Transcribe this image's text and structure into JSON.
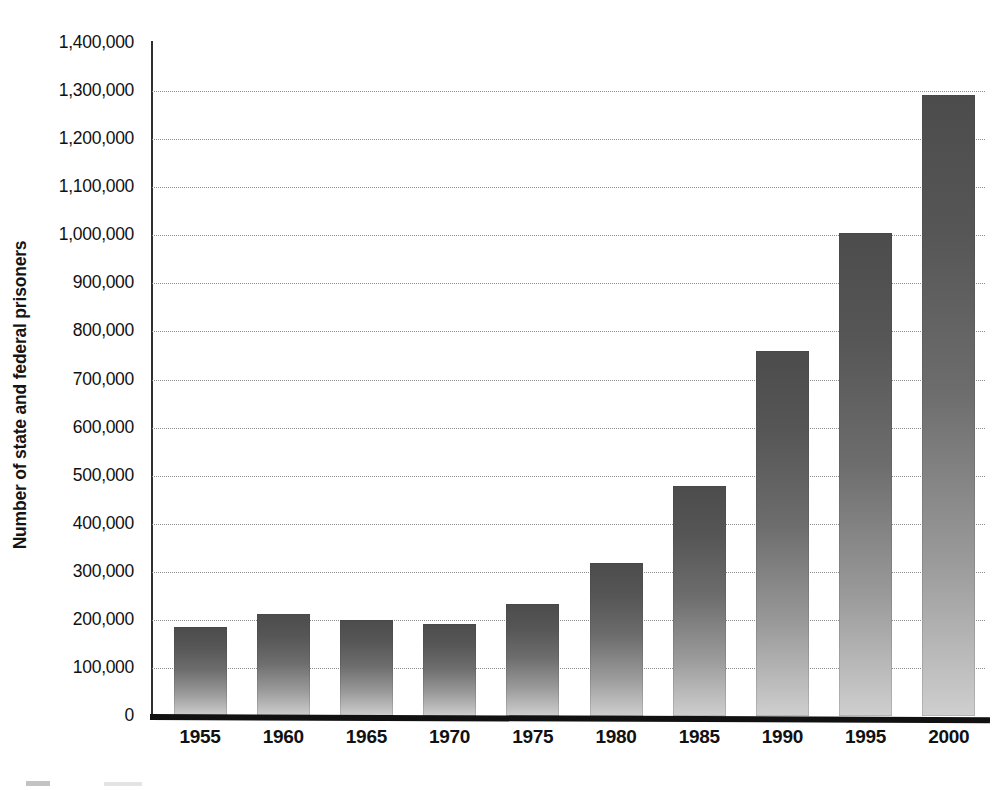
{
  "chart_data": {
    "type": "bar",
    "title": "",
    "xlabel": "",
    "ylabel": "Number of state and federal prisoners",
    "categories": [
      "1955",
      "1960",
      "1965",
      "1970",
      "1975",
      "1980",
      "1985",
      "1990",
      "1995",
      "2000"
    ],
    "values": [
      185000,
      213000,
      200000,
      191000,
      232000,
      319000,
      478000,
      760000,
      1005000,
      1291000
    ],
    "ylim": [
      0,
      1400000
    ],
    "ytick_labels": [
      "1,400,000",
      "1,300,000",
      "1,200,000",
      "1,100,000",
      "1,000,000",
      "900,000",
      "800,000",
      "700,000",
      "600,000",
      "500,000",
      "400,000",
      "300,000",
      "200,000",
      "100,000",
      "0"
    ],
    "ytick_values": [
      1400000,
      1300000,
      1200000,
      1100000,
      1000000,
      900000,
      800000,
      700000,
      600000,
      500000,
      400000,
      300000,
      200000,
      100000,
      0
    ],
    "ytick_interval": 100000,
    "grid": true,
    "grid_style": "dotted",
    "legend": false,
    "legend_position": "none",
    "bar_fill": "#6d6d6d",
    "bar_gradient_top": "#4c4c4c",
    "bar_gradient_bottom": "#cfcfcf",
    "axis_color": "#111111",
    "grid_color": "#8e8e8e",
    "background": "#ffffff",
    "annotations": []
  }
}
